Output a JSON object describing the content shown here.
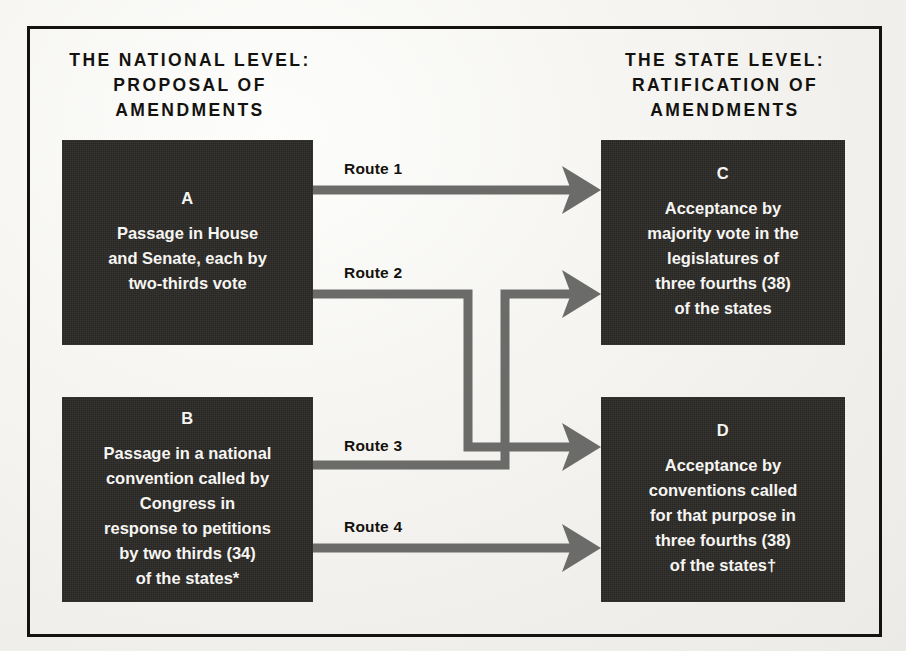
{
  "figure": {
    "title_left": "THE NATIONAL LEVEL:\nPROPOSAL OF\nAMENDMENTS",
    "title_right": "THE STATE LEVEL:\nRATIFICATION OF\nAMENDMENTS",
    "frame_color": "#15130f",
    "box_color": "#2a2825",
    "box_text_color": "#f6f5f2",
    "arrow_color": "#6b6b69",
    "background_color": "#f2f1ee"
  },
  "columns": {
    "left": {
      "heading_line1": "THE NATIONAL LEVEL:",
      "heading_line2": "PROPOSAL OF",
      "heading_line3": "AMENDMENTS"
    },
    "right": {
      "heading_line1": "THE STATE LEVEL:",
      "heading_line2": "RATIFICATION OF",
      "heading_line3": "AMENDMENTS"
    }
  },
  "nodes": [
    {
      "id": "A",
      "letter": "A",
      "text": "Passage in House\nand Senate, each by\ntwo-thirds vote",
      "column": "national"
    },
    {
      "id": "B",
      "letter": "B",
      "text": "Passage in a national\nconvention called by\nCongress in\nresponse to petitions\nby two thirds (34)\nof the states*",
      "column": "national"
    },
    {
      "id": "C",
      "letter": "C",
      "text": "Acceptance by\nmajority vote in the\nlegislatures of\nthree fourths (38)\nof the states",
      "column": "state"
    },
    {
      "id": "D",
      "letter": "D",
      "text": "Acceptance by\nconventions called\nfor that purpose in\nthree fourths (38)\nof the states†",
      "column": "state"
    }
  ],
  "routes": [
    {
      "id": "route-1",
      "label": "Route 1",
      "from": "A",
      "to": "C",
      "shape": "straight"
    },
    {
      "id": "route-2",
      "label": "Route 2",
      "from": "A",
      "to": "D",
      "shape": "right-down-right"
    },
    {
      "id": "route-3",
      "label": "Route 3",
      "from": "B",
      "to": "C",
      "shape": "right-up-right"
    },
    {
      "id": "route-4",
      "label": "Route 4",
      "from": "B",
      "to": "D",
      "shape": "straight"
    }
  ]
}
